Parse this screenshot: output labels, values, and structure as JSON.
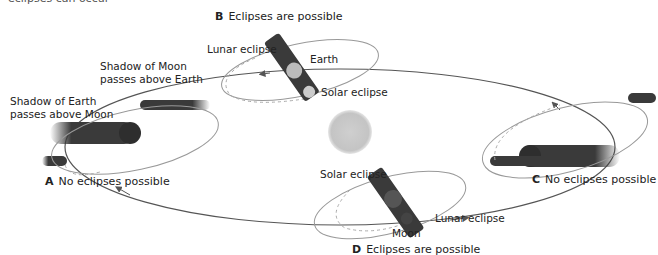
{
  "header": {
    "cut_text": "eclipses can occur"
  },
  "colors": {
    "orbit": "#555555",
    "moon_orbit": "#999999",
    "dashed": "#aaaaaa",
    "sun": "#c8c8c8",
    "shadow": "#3a3a3a"
  },
  "panels": {
    "A": {
      "letter": "A",
      "caption": "No eclipses possible",
      "labels": {
        "earth_shadow_1": "Shadow of Earth",
        "earth_shadow_2": "passes above Moon",
        "moon_shadow_1": "Shadow of Moon",
        "moon_shadow_2": "passes above Earth"
      }
    },
    "B": {
      "letter": "B",
      "caption": "Eclipses are possible",
      "labels": {
        "lunar": "Lunar eclipse",
        "earth": "Earth",
        "solar": "Solar eclipse"
      }
    },
    "C": {
      "letter": "C",
      "caption": "No eclipses possible"
    },
    "D": {
      "letter": "D",
      "caption": "Eclipses are possible",
      "labels": {
        "solar": "Solar eclipse",
        "lunar": "Lunar eclipse",
        "moon": "Moon"
      }
    }
  },
  "center": {
    "name": "Sun"
  }
}
